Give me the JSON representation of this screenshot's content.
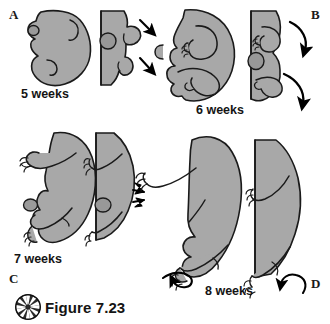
{
  "figure": {
    "caption": "Figure 7.23",
    "icon": "pinwheel-icon",
    "background_color": "#ffffff",
    "body_fill_color": "#a8a8a8",
    "body_fill_shadow_color": "#8f8f8f",
    "outline_color": "#1a1a1a",
    "arrow_color": "#000000"
  },
  "panels": [
    {
      "letter": "A",
      "week_label": "5 weeks",
      "position": "top-left",
      "views": [
        "lateral",
        "frontal"
      ],
      "arrows": 2,
      "arrow_style": "straight-down-right"
    },
    {
      "letter": "B",
      "week_label": "6 weeks",
      "position": "top-right",
      "views": [
        "lateral",
        "frontal"
      ],
      "arrows": 2,
      "arrow_style": "curved-clockwise"
    },
    {
      "letter": "C",
      "week_label": "7 weeks",
      "position": "bottom-left",
      "views": [
        "lateral",
        "frontal"
      ],
      "arrows": 2,
      "arrow_style": "chevron-pair"
    },
    {
      "letter": "D",
      "week_label": "8 weeks",
      "position": "bottom-right",
      "views": [
        "lateral",
        "frontal"
      ],
      "arrows": 2,
      "arrow_style": "looped-rotation"
    }
  ],
  "letters": {
    "a": "A",
    "b": "B",
    "c": "C",
    "d": "D"
  },
  "weeks": {
    "w5": "5 weeks",
    "w6": "6 weeks",
    "w7": "7 weeks",
    "w8": "8 weeks"
  }
}
